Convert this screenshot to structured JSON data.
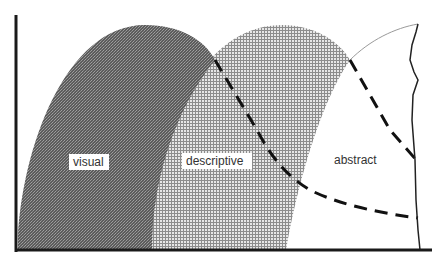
{
  "diagram": {
    "type": "overlapping-region-diagram",
    "regions": [
      {
        "id": "visual",
        "label": "visual",
        "fill": "#6e6e6e",
        "pattern": "dense-dark-dither"
      },
      {
        "id": "descriptive",
        "label": "descriptive",
        "fill": "#bdbdbd",
        "pattern": "light-grid"
      },
      {
        "id": "abstract",
        "label": "abstract",
        "fill": "#ffffff",
        "pattern": "none"
      }
    ],
    "axes": {
      "color": "#1a1a1a",
      "x_axis": "horizontal baseline",
      "y_axis": "vertical left edge"
    },
    "boundary_lines": [
      {
        "id": "dashed-boundary-1",
        "style": "dashed",
        "color": "#111111"
      },
      {
        "id": "dashed-boundary-2",
        "style": "dashed",
        "color": "#111111"
      },
      {
        "id": "jagged-right-edge",
        "style": "solid-irregular",
        "color": "#222222"
      }
    ]
  },
  "labels": {
    "visual": "visual",
    "descriptive": "descriptive",
    "abstract": "abstract"
  }
}
